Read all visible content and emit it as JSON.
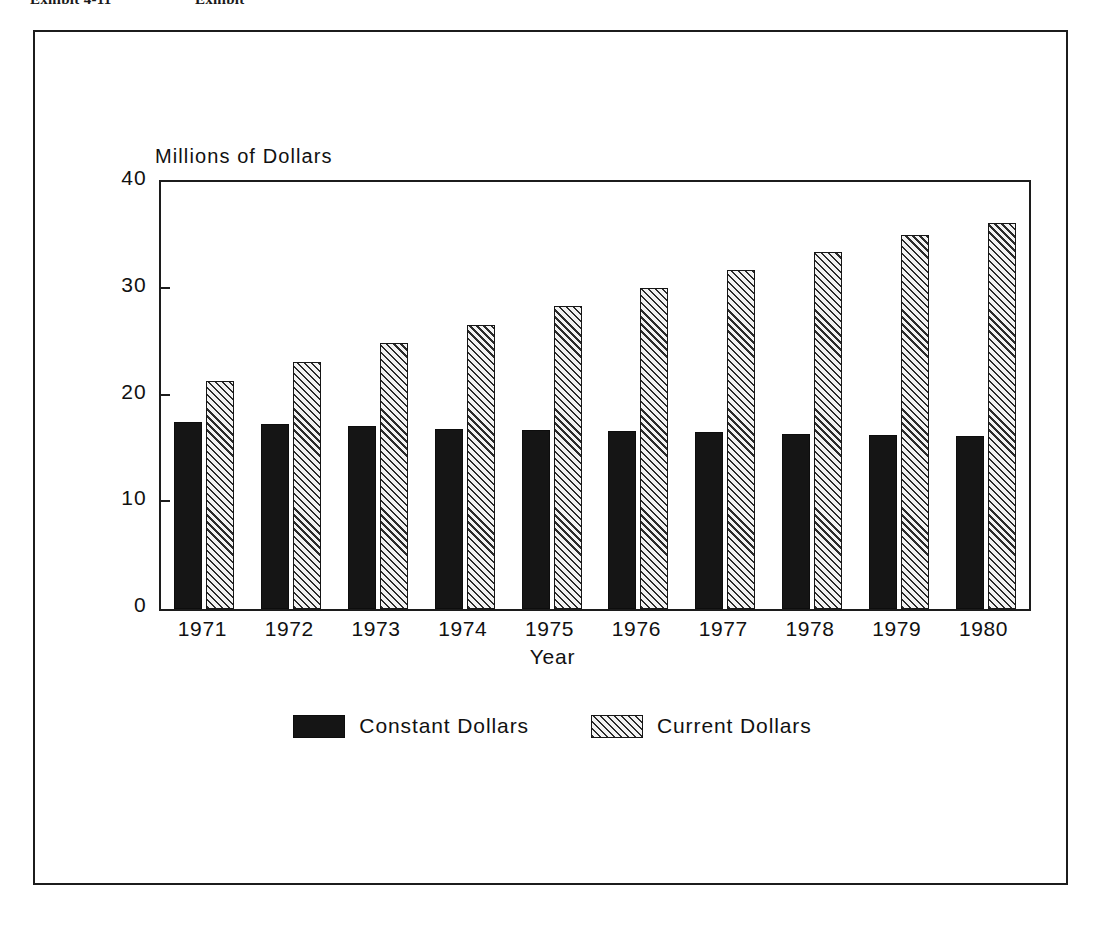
{
  "page_header": {
    "exhibit_label": "Exhibit 4-11",
    "exhibit_title": "Exhibit"
  },
  "chart_data": {
    "type": "bar",
    "title": "",
    "subtitle": "",
    "xlabel": "Year",
    "ylabel": "Millions of Dollars",
    "categories": [
      "1971",
      "1972",
      "1973",
      "1974",
      "1975",
      "1976",
      "1977",
      "1978",
      "1979",
      "1980"
    ],
    "series": [
      {
        "name": "Constant Dollars",
        "fill": "solid-black",
        "color": "#151515",
        "values": [
          17.5,
          17.3,
          17.1,
          16.9,
          16.8,
          16.7,
          16.6,
          16.4,
          16.3,
          16.2
        ]
      },
      {
        "name": "Current Dollars",
        "fill": "diagonal-hatch",
        "color": "#e9e9e9",
        "values": [
          21.4,
          23.1,
          24.9,
          26.6,
          28.4,
          30.1,
          31.8,
          33.4,
          35.0,
          36.2
        ]
      }
    ],
    "ylim": [
      0,
      40
    ],
    "yticks": [
      0,
      10,
      20,
      30,
      40
    ],
    "ytick_labels": [
      "0",
      "10",
      "20",
      "30",
      "40"
    ],
    "grid": false,
    "legend_position": "bottom-center",
    "legend_entries": [
      "Constant Dollars",
      "Current Dollars"
    ]
  }
}
